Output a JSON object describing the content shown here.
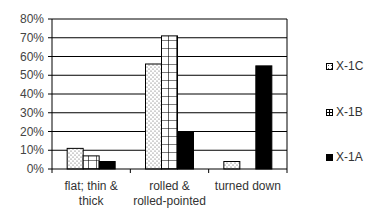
{
  "chart_data": {
    "type": "bar",
    "title": "",
    "xlabel": "",
    "ylabel": "",
    "values_source": "estimated from bar heights against gridlines; the chart shows no data labels",
    "ylim": [
      0,
      80
    ],
    "yticks": [
      "0%",
      "10%",
      "20%",
      "30%",
      "40%",
      "50%",
      "60%",
      "70%",
      "80%"
    ],
    "grid": true,
    "legend_position": "right",
    "categories": [
      [
        "flat; thin &",
        "thick"
      ],
      [
        "rolled &",
        "rolled-pointed"
      ],
      [
        "turned down"
      ]
    ],
    "series": [
      {
        "name": "X-1C",
        "pattern": "dotted",
        "values": [
          11,
          56,
          4
        ]
      },
      {
        "name": "X-1B",
        "pattern": "grid",
        "values": [
          7,
          71,
          0
        ]
      },
      {
        "name": "X-1A",
        "pattern": "solid-black",
        "values": [
          4,
          20,
          55
        ]
      }
    ]
  },
  "legend": {
    "items": [
      {
        "label": "X-1C"
      },
      {
        "label": "X-1B"
      },
      {
        "label": "X-1A"
      }
    ]
  }
}
